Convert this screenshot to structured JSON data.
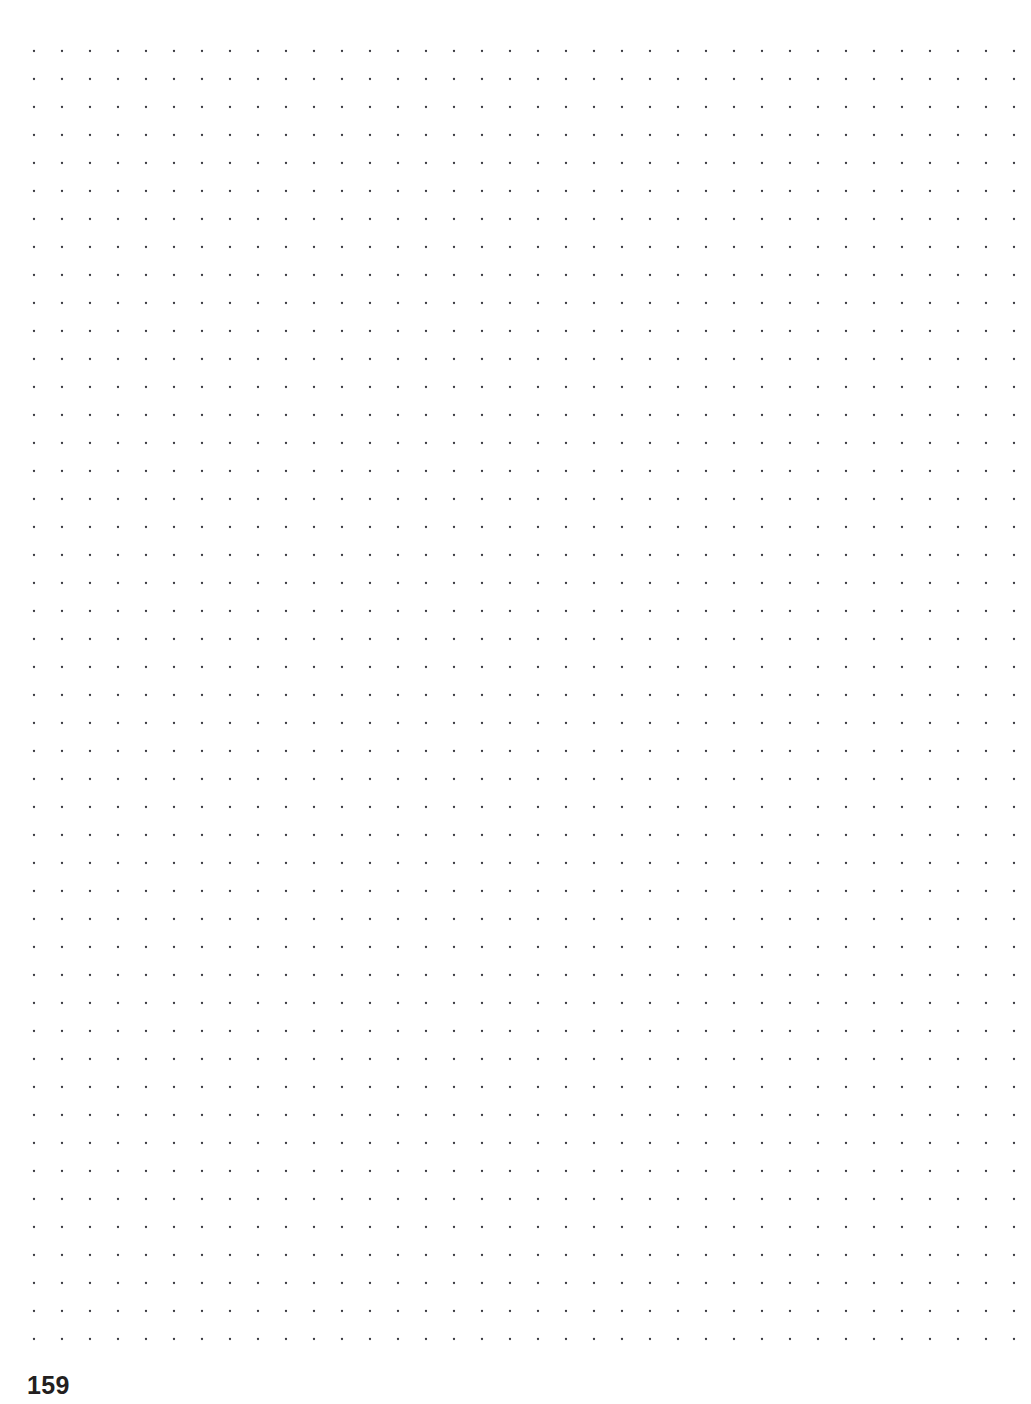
{
  "page": {
    "width": 1031,
    "height": 1404,
    "background_color": "#ffffff",
    "kind": "dot-grid-notebook-page",
    "content_text": ""
  },
  "dot_grid": {
    "icon_name": "dot-grid-pattern",
    "dot_color": "#3a3a40",
    "dot_radius": 1.15,
    "spacing_x": 28,
    "spacing_y": 28,
    "origin_x": 34,
    "origin_y": 51,
    "columns": 36,
    "rows": 47,
    "last_dot_x": 1014,
    "last_dot_y": 1341
  },
  "footer": {
    "page_number": "159",
    "page_number_color": "#231f20",
    "page_number_left": 27,
    "page_number_top": 1373
  }
}
